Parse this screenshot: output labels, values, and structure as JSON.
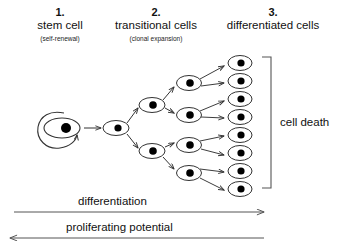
{
  "figure": {
    "background": "#ffffff",
    "stroke_color": "#333333",
    "text_color": "#111111"
  },
  "columns": [
    {
      "number": "1.",
      "title": "stem cell",
      "subtitle": "(self-renewal)"
    },
    {
      "number": "2.",
      "title": "transitional cells",
      "subtitle": "(clonal expansion)"
    },
    {
      "number": "3.",
      "title": "differentiated cells",
      "subtitle": ""
    }
  ],
  "annotations": {
    "cell_death": "cell death",
    "differentiation": "differentiation",
    "proliferating_potential": "proliferating potential"
  },
  "cells": {
    "stem": [
      {
        "cx": 62,
        "cy": 128,
        "rx": 18,
        "ry": 10,
        "nr": 5
      }
    ],
    "transitional_gen1": [
      {
        "cx": 116,
        "cy": 128,
        "rx": 13,
        "ry": 7.5,
        "nr": 3.6
      }
    ],
    "transitional_gen2": [
      {
        "cx": 152,
        "cy": 105,
        "rx": 13,
        "ry": 7.5,
        "nr": 3.8
      },
      {
        "cx": 152,
        "cy": 151,
        "rx": 13,
        "ry": 7.5,
        "nr": 3.8
      }
    ],
    "transitional_gen3": [
      {
        "cx": 189,
        "cy": 83,
        "rx": 12.5,
        "ry": 7.5,
        "nr": 3.8
      },
      {
        "cx": 189,
        "cy": 115,
        "rx": 12.5,
        "ry": 7.5,
        "nr": 3.8
      },
      {
        "cx": 189,
        "cy": 145,
        "rx": 12.5,
        "ry": 7.5,
        "nr": 3.8
      },
      {
        "cx": 189,
        "cy": 173,
        "rx": 12.5,
        "ry": 7.5,
        "nr": 3.8
      }
    ],
    "differentiated": [
      {
        "cx": 240,
        "cy": 63,
        "rx": 12,
        "ry": 7.5,
        "nr": 3.6
      },
      {
        "cx": 240,
        "cy": 81,
        "rx": 12,
        "ry": 7.5,
        "nr": 3.6
      },
      {
        "cx": 240,
        "cy": 99,
        "rx": 12,
        "ry": 7.5,
        "nr": 3.6
      },
      {
        "cx": 240,
        "cy": 117,
        "rx": 12,
        "ry": 7.5,
        "nr": 3.6
      },
      {
        "cx": 240,
        "cy": 135,
        "rx": 12,
        "ry": 7.5,
        "nr": 3.6
      },
      {
        "cx": 240,
        "cy": 153,
        "rx": 12,
        "ry": 7.5,
        "nr": 3.6
      },
      {
        "cx": 240,
        "cy": 171,
        "rx": 12,
        "ry": 7.5,
        "nr": 3.6
      },
      {
        "cx": 240,
        "cy": 189,
        "rx": 12,
        "ry": 7.5,
        "nr": 3.6
      }
    ]
  },
  "counts": {
    "stem_cells": 1,
    "transitional_cells": 7,
    "differentiated_cells": 8
  }
}
